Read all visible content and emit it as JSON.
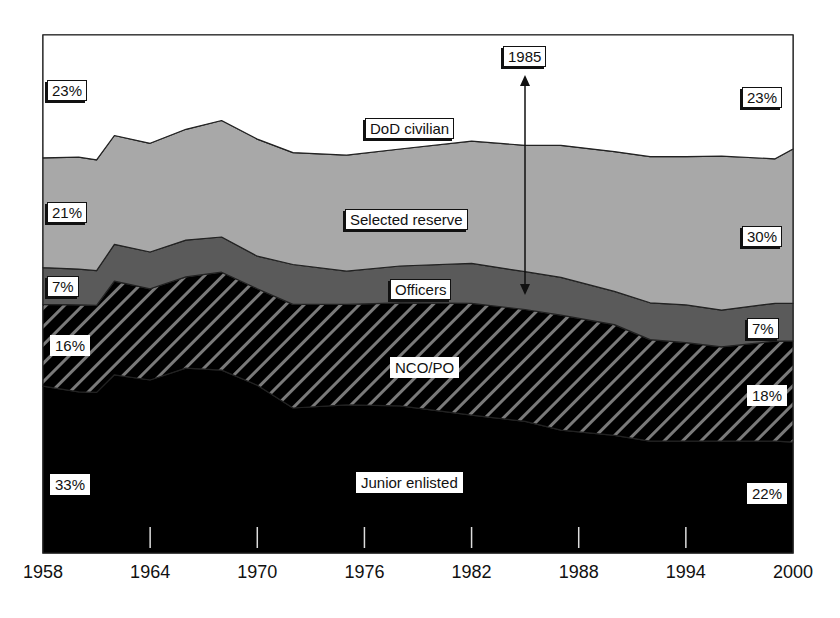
{
  "chart_data": {
    "type": "area",
    "stacked": true,
    "title": "",
    "xlabel": "",
    "ylabel": "",
    "x_ticks": [
      "1958",
      "1964",
      "1970",
      "1976",
      "1982",
      "1988",
      "1994",
      "2000"
    ],
    "xlim": [
      1958,
      2000
    ],
    "ylim": [
      0,
      100
    ],
    "units": "percent of total",
    "grid": false,
    "legend": "inline labels",
    "x": [
      1958,
      1960,
      1961,
      1962,
      1964,
      1966,
      1968,
      1970,
      1972,
      1975,
      1978,
      1982,
      1985,
      1987,
      1990,
      1992,
      1994,
      1996,
      1999,
      2000
    ],
    "series": [
      {
        "name": "Junior enlisted",
        "fill": "#000000",
        "values": [
          32.2,
          31.1,
          31.0,
          34.4,
          33.4,
          35.7,
          35.3,
          32.4,
          28.0,
          28.6,
          28.4,
          26.6,
          25.4,
          23.7,
          22.7,
          21.6,
          21.6,
          21.6,
          21.6,
          21.4
        ]
      },
      {
        "name": "NCO/PO",
        "fill": "hatched",
        "hatch": {
          "background": "#000000",
          "stripe": "#7a7a7a"
        },
        "values": [
          15.8,
          16.8,
          16.8,
          18.1,
          17.6,
          17.6,
          18.9,
          18.6,
          20.0,
          19.4,
          19.9,
          21.6,
          21.6,
          22.2,
          21.4,
          19.6,
          19.0,
          18.2,
          19.3,
          19.5
        ]
      },
      {
        "name": "Officers",
        "fill": "#5a5a5a",
        "values": [
          7.1,
          6.9,
          6.7,
          7.1,
          7.1,
          7.1,
          6.8,
          6.3,
          7.7,
          6.4,
          7.1,
          7.7,
          7.3,
          7.3,
          6.4,
          7.1,
          7.3,
          7.1,
          7.3,
          7.3
        ]
      },
      {
        "name": "Selected reserve",
        "fill": "#a8a8a8",
        "values": [
          21.2,
          21.6,
          21.4,
          21.0,
          21.0,
          21.4,
          22.5,
          22.6,
          21.6,
          22.4,
          22.6,
          23.6,
          24.4,
          25.5,
          27.0,
          28.2,
          28.6,
          29.7,
          27.9,
          29.8
        ]
      },
      {
        "name": "DoD civilian",
        "fill": "#ffffff",
        "values": [
          23.7,
          23.6,
          24.1,
          19.4,
          20.9,
          18.2,
          16.5,
          20.1,
          22.7,
          23.2,
          22.0,
          20.5,
          21.3,
          21.3,
          22.5,
          23.5,
          23.5,
          23.4,
          23.9,
          22.0
        ]
      }
    ],
    "annotations": [
      {
        "text": "1985",
        "type": "double-arrow",
        "x": 1985,
        "span": "Selected reserve (top to bottom)"
      }
    ],
    "endpoint_labels": {
      "left_1958": {
        "DoD civilian": "23%",
        "Selected reserve": "21%",
        "Officers": "7%",
        "NCO/PO": "16%",
        "Junior enlisted": "33%"
      },
      "right_2000": {
        "DoD civilian": "23%",
        "Selected reserve": "30%",
        "Officers": "7%",
        "NCO/PO": "18%",
        "Junior enlisted": "22%"
      }
    }
  },
  "labels": {
    "series": {
      "dod_civilian": "DoD civilian",
      "selected_reserve": "Selected reserve",
      "officers": "Officers",
      "nco_po": "NCO/PO",
      "junior_enlisted": "Junior enlisted"
    },
    "left": {
      "dod_civilian": "23%",
      "selected_reserve": "21%",
      "officers": "7%",
      "nco_po": "16%",
      "junior_enlisted": "33%"
    },
    "right": {
      "dod_civilian": "23%",
      "selected_reserve": "30%",
      "officers": "7%",
      "nco_po": "18%",
      "junior_enlisted": "22%"
    },
    "marker_year": "1985"
  },
  "axis": {
    "x_ticks": [
      "1958",
      "1964",
      "1970",
      "1976",
      "1982",
      "1988",
      "1994",
      "2000"
    ]
  }
}
